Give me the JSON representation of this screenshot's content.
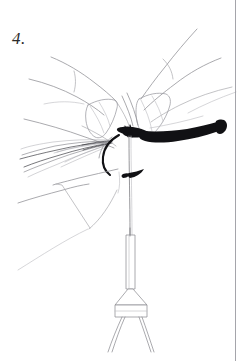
{
  "page": {
    "background_color": "#ffffff",
    "width": 244,
    "height": 361
  },
  "step": {
    "label": "4.",
    "number": 4
  },
  "illustration": {
    "name": "hands-tying-thread-on-hook",
    "style": "pen-and-ink line drawing",
    "line_color": "#8d8d93",
    "accent_color": "#111114",
    "parts": [
      {
        "name": "upper-left-finger",
        "description": "index finger entering from upper left with knuckle crease"
      },
      {
        "name": "upper-right-finger",
        "description": "index finger entering from upper right with knuckle crease"
      },
      {
        "name": "upper-right-second-finger",
        "description": "second finger behind the right index finger"
      },
      {
        "name": "left-fingertip-nail",
        "description": "fingertip with fingernail pressing the thread"
      },
      {
        "name": "right-fingertip-nail",
        "description": "fingertip with fingernail pressing the thread"
      },
      {
        "name": "lower-left-thumb",
        "description": "thumb coming from lower left"
      },
      {
        "name": "hackle-fibers",
        "description": "bunch of fine hackle fibers fanning to the left"
      },
      {
        "name": "dark-thread-loop",
        "description": "dark thread loop curving below the knot"
      },
      {
        "name": "hook-shank",
        "description": "dark tapering hook shank extending to the right with a bend"
      },
      {
        "name": "tying-thread",
        "description": "thin vertical thread running down from the knot"
      },
      {
        "name": "arrow-marker",
        "description": "small dark arrowhead on the thread below the knot"
      },
      {
        "name": "bobbin-tube",
        "description": "bobbin tube hanging on the thread"
      },
      {
        "name": "bobbin-holder",
        "description": "bobbin holder body with two splayed legs"
      }
    ]
  },
  "border": {
    "name": "page-rule",
    "visible": true,
    "color": "#9b9ba1",
    "position": "right"
  }
}
